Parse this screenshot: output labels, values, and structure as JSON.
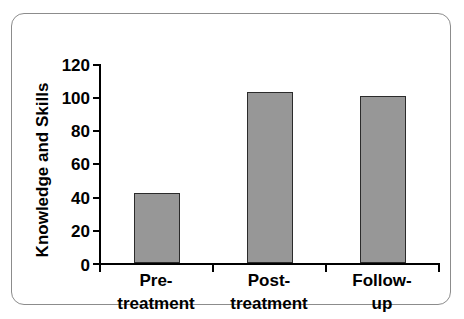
{
  "chart_data": {
    "type": "bar",
    "title": "",
    "xlabel": "",
    "ylabel": "Knowledge and Skills",
    "categories": [
      "Pre-treatment",
      "Post-treatment",
      "Follow-up"
    ],
    "category_lines": [
      [
        "Pre-",
        "treatment"
      ],
      [
        "Post-",
        "treatment"
      ],
      [
        "Follow-",
        "up"
      ]
    ],
    "values": [
      42,
      103,
      101
    ],
    "ylim": [
      0,
      120
    ],
    "ytick_values": [
      0,
      20,
      40,
      60,
      80,
      100,
      120
    ],
    "ytick_labels": [
      "0",
      "20",
      "40",
      "60",
      "80",
      "100",
      "120"
    ],
    "grid": false,
    "legend": false,
    "legend_position": "none",
    "bar_fill_color": "#979797",
    "bar_edge_color": "#2b2b2b",
    "axis_color": "#000000",
    "frame_border_color": "#8c8c8c",
    "background_color": "#ffffff"
  }
}
